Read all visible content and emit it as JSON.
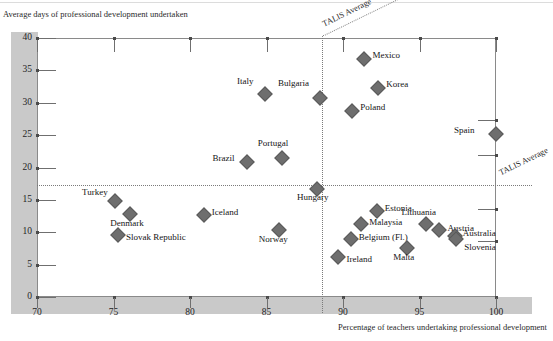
{
  "chart_data": {
    "type": "scatter",
    "title": "",
    "ylabel": "Average days of professional development undertaken",
    "xlabel": "Percentage of teachers undertaking professional development",
    "xlim": [
      70,
      100
    ],
    "ylim": [
      0,
      40
    ],
    "xticks": [
      "70",
      "75",
      "80",
      "85",
      "90",
      "95",
      "100"
    ],
    "yticks": [
      "0",
      "5",
      "10",
      "15",
      "20",
      "25",
      "30",
      "35",
      "40"
    ],
    "grid": false,
    "legend": "none",
    "marker_color": "#6e6e6e",
    "reference_lines": [
      {
        "name": "talis-average-vertical",
        "orientation": "vertical",
        "value": 88.6,
        "label": "TALIS Average"
      },
      {
        "name": "talis-average-horizontal",
        "orientation": "horizontal",
        "value": 17.3,
        "label": "TALIS Average"
      }
    ],
    "points": [
      {
        "label": "Mexico",
        "x": 91.4,
        "y": 36.8,
        "lx": 8,
        "ly": -3
      },
      {
        "label": "Korea",
        "x": 92.3,
        "y": 32.3,
        "lx": 8,
        "ly": -3
      },
      {
        "label": "Poland",
        "x": 90.6,
        "y": 28.8,
        "lx": 8,
        "ly": -3
      },
      {
        "label": "Spain",
        "x": 100.0,
        "y": 25.2,
        "lx": -42,
        "ly": -3
      },
      {
        "label": "Bulgaria",
        "x": 88.5,
        "y": 30.7,
        "lx": -42,
        "ly": -14
      },
      {
        "label": "Italy",
        "x": 84.9,
        "y": 31.3,
        "lx": -28,
        "ly": -12
      },
      {
        "label": "Portugal",
        "x": 86.0,
        "y": 21.5,
        "lx": -24,
        "ly": -14
      },
      {
        "label": "Brazil",
        "x": 83.7,
        "y": 20.8,
        "lx": -34,
        "ly": -3
      },
      {
        "label": "Hungary",
        "x": 88.3,
        "y": 16.7,
        "lx": -20,
        "ly": 9
      },
      {
        "label": "Turkey",
        "x": 75.1,
        "y": 14.9,
        "lx": -33,
        "ly": -8
      },
      {
        "label": "Denmark",
        "x": 76.1,
        "y": 12.8,
        "lx": -20,
        "ly": 10
      },
      {
        "label": "Iceland",
        "x": 80.9,
        "y": 12.7,
        "lx": 8,
        "ly": -2
      },
      {
        "label": "Slovak Republic",
        "x": 75.3,
        "y": 9.6,
        "lx": 8,
        "ly": 3
      },
      {
        "label": "Norway",
        "x": 85.8,
        "y": 10.4,
        "lx": -20,
        "ly": 10
      },
      {
        "label": "Estonia",
        "x": 92.2,
        "y": 13.3,
        "lx": 8,
        "ly": -2
      },
      {
        "label": "Malaysia",
        "x": 91.2,
        "y": 11.3,
        "lx": 8,
        "ly": -1
      },
      {
        "label": "Lithuania",
        "x": 95.4,
        "y": 11.2,
        "lx": -24,
        "ly": -11
      },
      {
        "label": "Austria",
        "x": 96.3,
        "y": 10.4,
        "lx": 8,
        "ly": -1
      },
      {
        "label": "Belgium (Fl.)",
        "x": 90.5,
        "y": 9.0,
        "lx": 8,
        "ly": -1
      },
      {
        "label": "Australia",
        "x": 97.3,
        "y": 9.4,
        "lx": 8,
        "ly": -2
      },
      {
        "label": "Slovenia",
        "x": 97.4,
        "y": 8.9,
        "lx": 8,
        "ly": 9
      },
      {
        "label": "Malta",
        "x": 94.2,
        "y": 7.6,
        "lx": -14,
        "ly": 10
      },
      {
        "label": "Ireland",
        "x": 89.7,
        "y": 6.2,
        "lx": 8,
        "ly": 3
      }
    ]
  }
}
